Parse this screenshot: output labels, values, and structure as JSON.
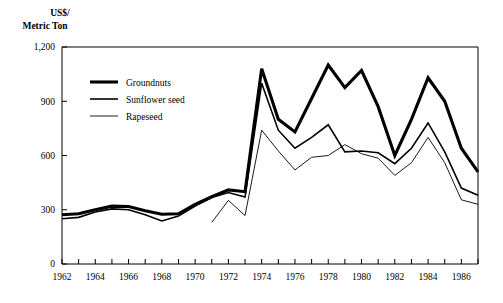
{
  "chart_data": {
    "type": "line",
    "title": "",
    "subtitle": "",
    "ylabel_line1": "US$/",
    "ylabel_line2": "Metric Ton",
    "xlabel": "",
    "ylim": [
      0,
      1200
    ],
    "xlim": [
      1962,
      1987
    ],
    "grid": false,
    "legend_position": "upper-left-inside",
    "y_ticks": [
      0,
      300,
      600,
      900,
      1200
    ],
    "y_tick_labels": [
      "0",
      "300",
      "600",
      "900",
      "1,200"
    ],
    "x_ticks": [
      1962,
      1963,
      1964,
      1965,
      1966,
      1967,
      1968,
      1969,
      1970,
      1971,
      1972,
      1973,
      1974,
      1975,
      1976,
      1977,
      1978,
      1979,
      1980,
      1981,
      1982,
      1983,
      1984,
      1985,
      1986,
      1987
    ],
    "x_tick_labels_shown": [
      "1962",
      "1964",
      "1966",
      "1968",
      "1970",
      "1972",
      "1974",
      "1976",
      "1978",
      "1980",
      "1982",
      "1984",
      "1986"
    ],
    "x": [
      1962,
      1963,
      1964,
      1965,
      1966,
      1967,
      1968,
      1969,
      1970,
      1971,
      1972,
      1973,
      1974,
      1975,
      1976,
      1977,
      1978,
      1979,
      1980,
      1981,
      1982,
      1983,
      1984,
      1985,
      1986,
      1987
    ],
    "series": [
      {
        "name": "Groundnuts",
        "stroke_width": 3.1,
        "color": "#000000",
        "values": [
          272,
          278,
          300,
          320,
          318,
          295,
          275,
          278,
          330,
          372,
          410,
          400,
          1080,
          800,
          730,
          915,
          1100,
          975,
          1070,
          870,
          600,
          800,
          1030,
          900,
          640,
          510
        ]
      },
      {
        "name": "Sunflower seed",
        "stroke_width": 1.6,
        "color": "#000000",
        "values": [
          250,
          258,
          288,
          305,
          300,
          272,
          238,
          265,
          320,
          368,
          395,
          370,
          1000,
          740,
          640,
          700,
          770,
          620,
          625,
          615,
          555,
          640,
          780,
          620,
          420,
          380
        ]
      },
      {
        "name": "Rapeseed",
        "stroke_width": 0.9,
        "color": "#000000",
        "values": [
          null,
          null,
          null,
          null,
          null,
          null,
          null,
          null,
          null,
          230,
          352,
          268,
          740,
          625,
          520,
          590,
          600,
          660,
          610,
          585,
          490,
          560,
          700,
          560,
          355,
          330
        ]
      }
    ],
    "legend": [
      {
        "label": "Groundnuts",
        "stroke_width": 3.1
      },
      {
        "label": "Sunflower seed",
        "stroke_width": 1.6
      },
      {
        "label": "Rapeseed",
        "stroke_width": 0.9
      }
    ]
  }
}
